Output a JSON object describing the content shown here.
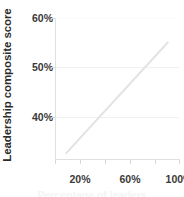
{
  "chart_data": {
    "type": "line",
    "title": "",
    "xlabel": "",
    "ylabel": "Leadership composite score",
    "xlim": [
      0,
      110
    ],
    "ylim": [
      33.5,
      60
    ],
    "grid": true,
    "legend": false,
    "line_color": "#e3e3e3",
    "text_color": "#3a3a3a",
    "grid_color": "#f1f1f1",
    "axis_color": "#e0e0e0",
    "x_tick_values": [
      20,
      40,
      60,
      80,
      100
    ],
    "x_tick_labels": [
      "20%",
      "",
      "60%",
      "",
      "100%"
    ],
    "y_tick_values": [
      40,
      50,
      60
    ],
    "y_tick_labels": [
      "40%",
      "50%",
      "60%"
    ],
    "series": [
      {
        "name": "trend",
        "x": [
          10,
          100
        ],
        "values": [
          34.6,
          55.4
        ]
      }
    ]
  },
  "axis": {
    "y_title": "Leadership composite score",
    "y_labels": [
      "60%",
      "50%",
      "40%"
    ],
    "x_labels": [
      "20%",
      "60%",
      "100%"
    ],
    "bottom_partial": "Percentage of leaders"
  }
}
